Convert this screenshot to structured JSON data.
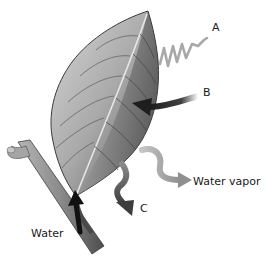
{
  "diagram": {
    "labels": {
      "a": "A",
      "b": "B",
      "c": "C",
      "water_vapor": "Water vapor",
      "water": "Water"
    },
    "arrows": [
      {
        "id": "A",
        "style": "wavy-line",
        "direction": "into-leaf",
        "color": "#a8a8a8"
      },
      {
        "id": "B",
        "style": "curved-arrow",
        "direction": "into-leaf",
        "color": "#1e1e1e"
      },
      {
        "id": "water-vapor",
        "style": "wavy-arrow",
        "direction": "out-of-leaf",
        "color": "#9a9a9a"
      },
      {
        "id": "C",
        "style": "wavy-arrow",
        "direction": "out-of-leaf",
        "color": "#555555"
      },
      {
        "id": "water",
        "style": "straight-arrow",
        "direction": "up-petiole-into-leaf",
        "color": "#111111"
      }
    ],
    "colors": {
      "leaf_light": "#c9c9c9",
      "leaf_dark": "#4a4a4a",
      "stem": "#7a7a7a",
      "background": "#ffffff"
    }
  }
}
